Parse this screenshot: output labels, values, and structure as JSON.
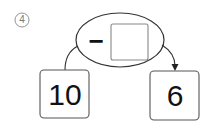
{
  "problem": {
    "number_label": "④",
    "operator": "−",
    "answer_box_value": "",
    "start_value": "10",
    "result_value": "6"
  },
  "colors": {
    "stroke": "#333333",
    "box_stroke": "#555555",
    "answer_box_stroke": "#888888",
    "number_label": "#777777"
  }
}
